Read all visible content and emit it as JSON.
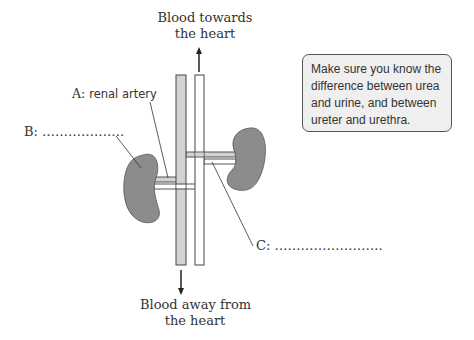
{
  "diagram": {
    "top_label": [
      "Blood towards",
      "the heart"
    ],
    "bottom_label": [
      "Blood away from",
      "the heart"
    ],
    "label_a": {
      "prefix": "A:",
      "name": "renal artery"
    },
    "label_b": {
      "prefix": "B:",
      "blank": "………………."
    },
    "label_c": {
      "prefix": "C:",
      "blank": "……………………."
    },
    "note": "Make sure you know the difference between urea and urine, and between ureter and urethra.",
    "colors": {
      "kidney": "#8c8c8c",
      "artery": "#d2d2d2",
      "vein": "#ffffff",
      "note_bg": "#efefef",
      "outline": "#444444"
    }
  }
}
